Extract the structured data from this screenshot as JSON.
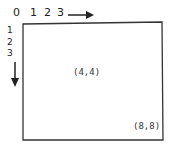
{
  "diagram": {
    "x_axis_labels": [
      "0",
      "1",
      "2",
      "3"
    ],
    "y_axis_labels": [
      "1",
      "2",
      "3"
    ],
    "x_axis_direction": "right-arrow",
    "y_axis_direction": "down-arrow",
    "points": [
      {
        "label": "(4,4)",
        "position": "center"
      },
      {
        "label": "(8,8)",
        "position": "bottom-right"
      }
    ],
    "stroke_color": "#222222",
    "background": "#ffffff"
  }
}
